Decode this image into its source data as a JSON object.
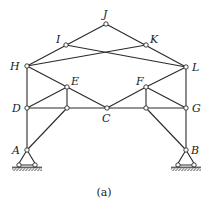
{
  "figure": {
    "caption": "(a)",
    "colors": {
      "line": "#2a2a2a",
      "node_fill": "#ffffff",
      "background": "#ffffff"
    }
  },
  "nodes": [
    {
      "id": "J",
      "label": "J",
      "x": 106,
      "y": 24,
      "lx": 103,
      "ly": 18
    },
    {
      "id": "I",
      "label": "I",
      "x": 66,
      "y": 45,
      "lx": 56,
      "ly": 43
    },
    {
      "id": "K",
      "label": "K",
      "x": 146,
      "y": 45,
      "lx": 150,
      "ly": 43
    },
    {
      "id": "H",
      "label": "H",
      "x": 27,
      "y": 66,
      "lx": 10,
      "ly": 70
    },
    {
      "id": "L",
      "label": "L",
      "x": 186,
      "y": 67,
      "lx": 192,
      "ly": 71
    },
    {
      "id": "E",
      "label": "E",
      "x": 67,
      "y": 87,
      "lx": 71,
      "ly": 85
    },
    {
      "id": "F",
      "label": "F",
      "x": 146,
      "y": 87,
      "lx": 136,
      "ly": 85
    },
    {
      "id": "D",
      "label": "D",
      "x": 27,
      "y": 108,
      "lx": 12,
      "ly": 112
    },
    {
      "id": "P1",
      "label": "",
      "x": 67,
      "y": 108,
      "lx": 0,
      "ly": 0
    },
    {
      "id": "C",
      "label": "C",
      "x": 107,
      "y": 108,
      "lx": 102,
      "ly": 122
    },
    {
      "id": "P2",
      "label": "",
      "x": 146,
      "y": 108,
      "lx": 0,
      "ly": 0
    },
    {
      "id": "G",
      "label": "G",
      "x": 186,
      "y": 108,
      "lx": 192,
      "ly": 112
    },
    {
      "id": "A",
      "label": "A",
      "x": 27,
      "y": 150,
      "lx": 12,
      "ly": 154
    },
    {
      "id": "B",
      "label": "B",
      "x": 186,
      "y": 150,
      "lx": 191,
      "ly": 154
    }
  ],
  "members": [
    [
      "H",
      "J"
    ],
    [
      "J",
      "L"
    ],
    [
      "I",
      "L"
    ],
    [
      "K",
      "H"
    ],
    [
      "H",
      "D"
    ],
    [
      "D",
      "A"
    ],
    [
      "L",
      "G"
    ],
    [
      "G",
      "B"
    ],
    [
      "H",
      "E"
    ],
    [
      "E",
      "C"
    ],
    [
      "L",
      "F"
    ],
    [
      "F",
      "C"
    ],
    [
      "D",
      "E"
    ],
    [
      "E",
      "P1"
    ],
    [
      "D",
      "P1"
    ],
    [
      "P1",
      "C"
    ],
    [
      "P1",
      "A"
    ],
    [
      "G",
      "F"
    ],
    [
      "F",
      "P2"
    ],
    [
      "G",
      "P2"
    ],
    [
      "P2",
      "C"
    ],
    [
      "P2",
      "B"
    ]
  ],
  "supports": [
    {
      "node": "A",
      "type": "pin"
    },
    {
      "node": "B",
      "type": "pin"
    }
  ]
}
